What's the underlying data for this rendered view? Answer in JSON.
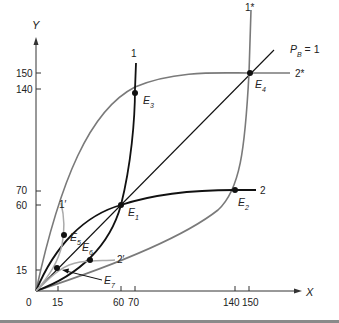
{
  "diagram": {
    "axes": {
      "x_title": "X",
      "y_title": "Y",
      "origin_label": "0",
      "x_ticks": [
        "15",
        "60",
        "70",
        "140",
        "150"
      ],
      "y_ticks": [
        "15",
        "60",
        "70",
        "140",
        "150"
      ]
    },
    "price_line_label": "P",
    "price_line_sub": "B",
    "price_line_value": " = 1",
    "curves": {
      "c1": "1",
      "c2": "2",
      "c1star": "1*",
      "c2star": "2*",
      "c1prime": "1′",
      "c2prime": "2′"
    },
    "points": [
      {
        "id": "E1",
        "letter": "E",
        "sub": "1",
        "x": 60,
        "y": 60
      },
      {
        "id": "E2",
        "letter": "E",
        "sub": "2",
        "x": 140,
        "y": 70
      },
      {
        "id": "E3",
        "letter": "E",
        "sub": "3",
        "x": 70,
        "y": 140
      },
      {
        "id": "E4",
        "letter": "E",
        "sub": "4",
        "x": 150,
        "y": 150
      },
      {
        "id": "E5",
        "letter": "E",
        "sub": "5",
        "x": 19,
        "y": 37
      },
      {
        "id": "E6",
        "letter": "E",
        "sub": "6",
        "x": 37,
        "y": 19
      },
      {
        "id": "E7",
        "letter": "E",
        "sub": "7",
        "x": 15,
        "y": 15
      }
    ],
    "colors": {
      "black_curve": "#111111",
      "gray_curve": "#7a7a7a",
      "light_gray_curve": "#aaaaaa"
    }
  }
}
